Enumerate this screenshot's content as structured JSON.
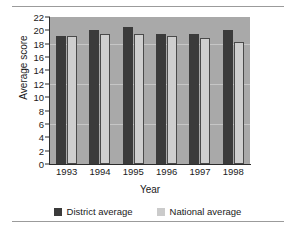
{
  "chart_data": {
    "type": "bar",
    "title": "",
    "xlabel": "Year",
    "ylabel": "Average score",
    "categories": [
      "1993",
      "1994",
      "1995",
      "1996",
      "1997",
      "1998"
    ],
    "series": [
      {
        "name": "District average",
        "color": "#3b3b3b",
        "values": [
          19.2,
          20.1,
          20.5,
          19.5,
          19.5,
          20.1
        ]
      },
      {
        "name": "National average",
        "color": "#cbcbcb",
        "values": [
          19.1,
          19.4,
          19.4,
          19.1,
          18.9,
          18.2
        ]
      }
    ],
    "ylim": [
      0,
      22
    ],
    "ytick_values": [
      22,
      20,
      18,
      16,
      14,
      12,
      10,
      8,
      6,
      4,
      2,
      0
    ],
    "yticks": [
      "22",
      "20",
      "18",
      "16",
      "14",
      "12",
      "10",
      "8",
      "6",
      "4",
      "2",
      "0"
    ],
    "grid": true,
    "legend_position": "bottom",
    "plot_background": "#a9a9a9"
  }
}
